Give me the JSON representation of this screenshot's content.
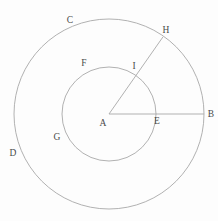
{
  "figure": {
    "background_color": "#fdfdfd",
    "line_color": "#a8a8a8",
    "label_color": "#4a4a4a",
    "width": 218,
    "height": 221,
    "center": {
      "x": 109,
      "y": 114
    },
    "circles": [
      {
        "name": "outer-circle",
        "radius": 95
      },
      {
        "name": "inner-circle",
        "radius": 47
      }
    ],
    "lines": [
      {
        "name": "radius-A-B",
        "angle_deg": 0,
        "length": 95
      },
      {
        "name": "radius-A-H",
        "angle_deg": 55,
        "length": 94
      }
    ],
    "labels": [
      {
        "text": "A",
        "x": 103,
        "y": 126,
        "role": "center-point"
      },
      {
        "text": "B",
        "x": 211,
        "y": 117,
        "role": "outer-circle-point"
      },
      {
        "text": "C",
        "x": 70,
        "y": 23,
        "role": "outer-circle-point"
      },
      {
        "text": "D",
        "x": 13,
        "y": 156,
        "role": "outer-circle-point"
      },
      {
        "text": "E",
        "x": 157,
        "y": 124,
        "role": "inner-intersection-point"
      },
      {
        "text": "F",
        "x": 84,
        "y": 66,
        "role": "inner-circle-point"
      },
      {
        "text": "G",
        "x": 57,
        "y": 140,
        "role": "inner-circle-point"
      },
      {
        "text": "H",
        "x": 166,
        "y": 33,
        "role": "outer-circle-point"
      },
      {
        "text": "I",
        "x": 134,
        "y": 69,
        "role": "inner-intersection-point"
      }
    ]
  }
}
